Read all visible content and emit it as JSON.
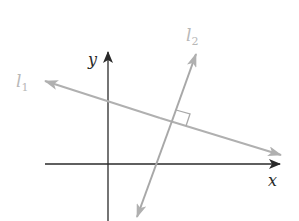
{
  "diagram": {
    "axes": {
      "x_label": "x",
      "y_label": "y",
      "color": "#2a2a2a"
    },
    "lines": [
      {
        "id": "l1",
        "label": "l",
        "subscript": "1",
        "color": "#b0b0b0",
        "label_color": "#b8b8b8"
      },
      {
        "id": "l2",
        "label": "l",
        "subscript": "2",
        "color": "#a8a8a8",
        "label_color": "#b8b8b8"
      }
    ],
    "annotations": {
      "right_angle_marker": "perpendicular"
    }
  }
}
